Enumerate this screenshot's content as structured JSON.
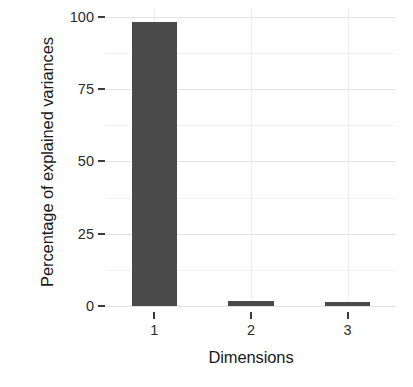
{
  "chart_data": {
    "type": "bar",
    "title": "",
    "subtitle": "",
    "xlabel": "Dimensions",
    "ylabel": "Percentage of explained variances",
    "categories": [
      "1",
      "2",
      "3"
    ],
    "values": [
      98.0,
      1.8,
      1.4
    ],
    "ylim": [
      0,
      103
    ],
    "y_ticks": [
      0,
      25,
      50,
      75,
      100
    ],
    "y_tick_labels": [
      "0",
      "25",
      "50",
      "75",
      "100"
    ],
    "y_minor_ticks": [
      12.5,
      37.5,
      62.5,
      87.5
    ],
    "x_tick_labels": [
      "1",
      "2",
      "3"
    ],
    "grid": true,
    "legend": "none",
    "bar_color": "#4a4a4a",
    "panel_background": "#ffffff",
    "gridline_major_color": "#e2e2e2",
    "gridline_minor_color": "#f1f1f1",
    "axis_text_color": "#2b2b2b",
    "axis_title_color": "#1a1a1a"
  }
}
